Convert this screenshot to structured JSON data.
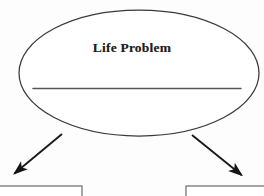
{
  "page": {
    "background_color": "#fdfdfd",
    "ink_color": "#231f20",
    "width": 264,
    "height": 196
  },
  "diagram": {
    "type": "flowchart",
    "title": "",
    "nodes": [
      {
        "id": "life-problem",
        "shape": "ellipse",
        "label": "Life Problem",
        "has_blank_write_in_line": true,
        "blank_line_label": "",
        "stroke_color": "#3a3a3c",
        "fill_color": "#ffffff",
        "center_x": 139,
        "center_y": 73,
        "radius_x": 120,
        "radius_y": 63
      },
      {
        "id": "outcome-box-left",
        "shape": "rectangle",
        "label": "",
        "stroke_color": "#6b6b6e",
        "fill_color": "#ffffff",
        "x": -6,
        "y": 186,
        "width": 88,
        "height": 20,
        "clipped": true
      },
      {
        "id": "outcome-box-right",
        "shape": "rectangle",
        "label": "",
        "stroke_color": "#6b6b6e",
        "fill_color": "#ffffff",
        "x": 186,
        "y": 186,
        "width": 86,
        "height": 20,
        "clipped": true
      }
    ],
    "connectors": [
      {
        "id": "arrow-left",
        "from": "life-problem",
        "to": "outcome-box-left",
        "direction": "down-left",
        "label": "",
        "stroke_color": "#1a1a1a",
        "x1": 62,
        "y1": 134,
        "x2": 11,
        "y2": 177
      },
      {
        "id": "arrow-right",
        "from": "life-problem",
        "to": "outcome-box-right",
        "direction": "down-right",
        "label": "",
        "stroke_color": "#1a1a1a",
        "x1": 192,
        "y1": 135,
        "x2": 245,
        "y2": 179
      }
    ]
  }
}
